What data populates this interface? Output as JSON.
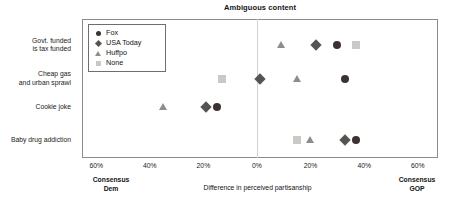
{
  "chart_data": {
    "type": "scatter",
    "title": "Ambiguous content",
    "xlabel": "Difference in perceived partisanship",
    "ylabel": "",
    "grid": false,
    "legend_position": "top-left",
    "xlim": [
      -65,
      65
    ],
    "xticks": [
      -60,
      -40,
      -20,
      0,
      20,
      40,
      60
    ],
    "xtick_labels": [
      "60%",
      "40%",
      "20%",
      "0%",
      "20%",
      "40%",
      "60%"
    ],
    "left_endcap": "Consensus\nDem",
    "right_endcap": "Consensus\nGOP",
    "categories": [
      "Govt. funded\nis tax funded",
      "Cheap gas\nand urban sprawl",
      "Cookie joke",
      "Baby drug addiction"
    ],
    "series": [
      {
        "name": "Fox",
        "marker": "circle",
        "color": "#3c3230",
        "values": [
          30,
          33,
          -15,
          37
        ]
      },
      {
        "name": "USA Today",
        "marker": "diamond",
        "color": "#545450",
        "values": [
          22,
          1,
          -19,
          33
        ]
      },
      {
        "name": "Huffpo",
        "marker": "triangle",
        "color": "#8d8d89",
        "values": [
          9,
          15,
          -35,
          20
        ]
      },
      {
        "name": "None",
        "marker": "square",
        "color": "#c9c9c5",
        "values": [
          37,
          -13,
          null,
          15
        ]
      }
    ]
  },
  "legend": {
    "items": [
      {
        "label": "Fox"
      },
      {
        "label": "USA Today"
      },
      {
        "label": "Huffpo"
      },
      {
        "label": "None"
      }
    ]
  }
}
